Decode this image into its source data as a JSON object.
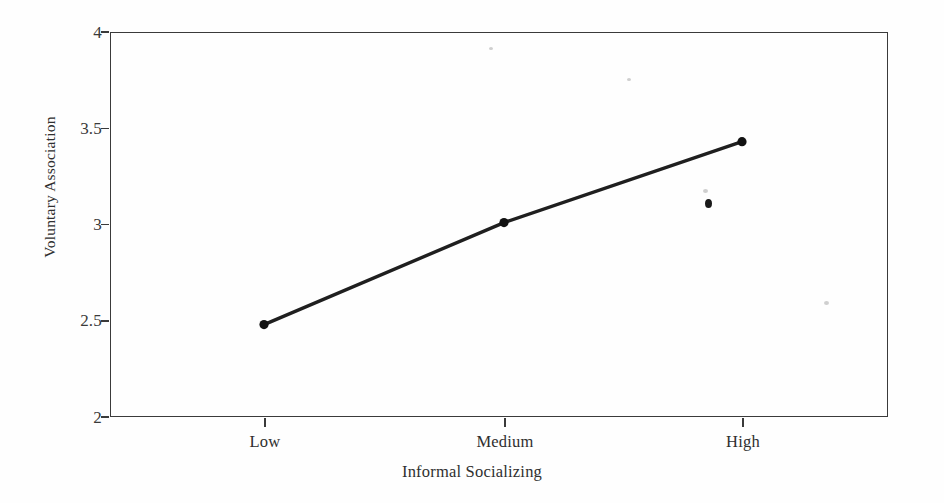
{
  "figure": {
    "background_color": "#fefefe",
    "axis_color": "#3a3a3a",
    "line_color": "#1f1f1f",
    "marker_color": "#111111"
  },
  "chart_data": {
    "type": "line",
    "title": "",
    "xlabel": "Informal Socializing",
    "ylabel": "Voluntary Association",
    "categories": [
      "Low",
      "Medium",
      "High"
    ],
    "values": [
      2.48,
      3.01,
      3.43
    ],
    "series": [
      {
        "name": "Voluntary Association",
        "values": [
          2.48,
          3.01,
          3.43
        ]
      }
    ],
    "ylim": [
      2,
      4
    ],
    "yticks": [
      2,
      2.5,
      3,
      3.5,
      4
    ],
    "ytick_labels": [
      "2",
      "2.5",
      "3",
      "3.5",
      "4"
    ],
    "xtick_labels": [
      "Low",
      "Medium",
      "High"
    ],
    "grid": false,
    "legend": false,
    "legend_position": "none",
    "markers": "filled-circle",
    "line_width": 3
  },
  "axes": {
    "y": {
      "title": "Voluntary Association",
      "ticks": [
        {
          "label": "4",
          "value": 4
        },
        {
          "label": "3.5",
          "value": 3.5
        },
        {
          "label": "3",
          "value": 3
        },
        {
          "label": "2.5",
          "value": 2.5
        },
        {
          "label": "2",
          "value": 2
        }
      ]
    },
    "x": {
      "title": "Informal Socializing",
      "ticks": [
        {
          "label": "Low"
        },
        {
          "label": "Medium"
        },
        {
          "label": "High"
        }
      ]
    }
  }
}
